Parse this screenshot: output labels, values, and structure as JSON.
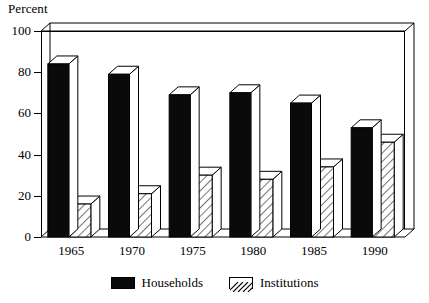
{
  "chart_data": {
    "type": "bar",
    "title": "",
    "subtitle": "",
    "ylabel": "Percent",
    "xlabel": "",
    "categories": [
      "1965",
      "1970",
      "1975",
      "1980",
      "1985",
      "1990"
    ],
    "series": [
      {
        "name": "Households",
        "values": [
          84,
          79,
          69,
          70,
          65,
          53
        ],
        "fill": "solid-black",
        "color": "#0a0a0a"
      },
      {
        "name": "Institutions",
        "values": [
          16,
          21,
          30,
          28,
          34,
          46
        ],
        "fill": "diagonal-hatch",
        "color": "#ffffff"
      }
    ],
    "ylim": [
      0,
      100
    ],
    "yticks": [
      0,
      20,
      40,
      60,
      80,
      100
    ],
    "ytick_labels": [
      "0",
      "20",
      "40",
      "60",
      "80",
      "100"
    ],
    "grid": false,
    "legend_position": "bottom",
    "style": "3d-perspective-bars"
  },
  "legend": {
    "entries": [
      {
        "label": "Households",
        "swatch": "solid"
      },
      {
        "label": "Institutions",
        "swatch": "hatch"
      }
    ]
  }
}
